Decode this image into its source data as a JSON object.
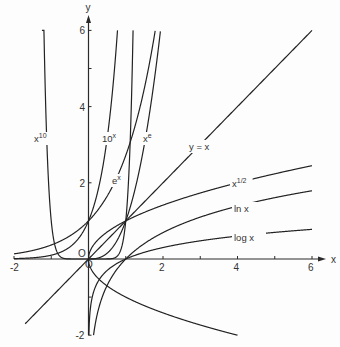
{
  "chart_data": {
    "type": "line",
    "title": "",
    "xlabel": "x",
    "ylabel": "y",
    "xlim": [
      -2,
      6.3
    ],
    "ylim": [
      -2,
      6.3
    ],
    "grid": false,
    "x_ticks": [
      -2,
      -1,
      1,
      2,
      3,
      4,
      5,
      6
    ],
    "x_tick_labels": [
      {
        "value": -2,
        "label": "-2"
      },
      {
        "value": 2,
        "label": "2"
      },
      {
        "value": 4,
        "label": "4"
      },
      {
        "value": 6,
        "label": "6"
      }
    ],
    "y_ticks": [
      -2,
      -1,
      2,
      4,
      5,
      6
    ],
    "y_tick_labels": [
      {
        "value": -2,
        "label": "-2"
      },
      {
        "value": 2,
        "label": "2"
      },
      {
        "value": 4,
        "label": "4"
      },
      {
        "value": 6,
        "label": "6"
      }
    ],
    "origin_labels": [
      "O",
      "O"
    ],
    "series": [
      {
        "name": "x^10",
        "label": "x",
        "label_sup": "10",
        "fn": "x^10",
        "domain": [
          -1.25,
          1.2
        ]
      },
      {
        "name": "10^x",
        "label": "10",
        "label_sup": "x",
        "fn": "10^x",
        "domain": [
          -2,
          0.78
        ]
      },
      {
        "name": "e^x",
        "label": "e",
        "label_sup": "x",
        "fn": "e^x",
        "domain": [
          -2,
          1.79
        ]
      },
      {
        "name": "x^e",
        "label": "x",
        "label_sup": "e",
        "fn": "x^e",
        "domain": [
          0,
          1.93
        ]
      },
      {
        "name": "y = x",
        "label": "y = x",
        "label_sup": "",
        "fn": "x",
        "domain": [
          -1.7,
          6
        ]
      },
      {
        "name": "x^1/2",
        "label": "x",
        "label_sup": "1/2",
        "fn": "sqrt(x)",
        "domain": [
          0,
          6
        ]
      },
      {
        "name": "ln x",
        "label": "ln x",
        "label_sup": "",
        "fn": "ln(x)",
        "domain": [
          0.135,
          6
        ]
      },
      {
        "name": "log x",
        "label": "log x",
        "label_sup": "",
        "fn": "log10(x)",
        "domain": [
          0.01,
          6
        ]
      },
      {
        "name": "-x^1/2",
        "label": "",
        "label_sup": "",
        "fn": "-sqrt(x)",
        "domain": [
          0,
          4
        ]
      }
    ],
    "annotations": [
      "x^10",
      "10^x",
      "x^e",
      "e^x",
      "y = x",
      "x^1/2",
      "ln x",
      "log x"
    ]
  }
}
